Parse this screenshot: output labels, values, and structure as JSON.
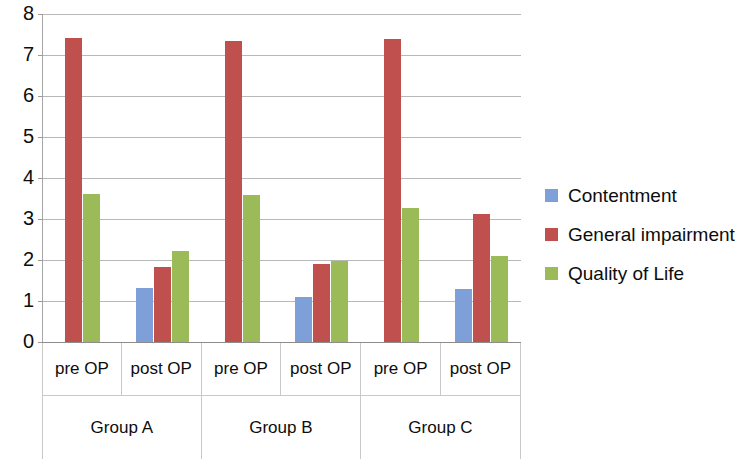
{
  "chart_data": {
    "type": "bar",
    "title": "",
    "subtitle": "",
    "xlabel": "",
    "ylabel": "",
    "ylim": [
      0,
      8
    ],
    "ytick_labels": [
      "8",
      "7",
      "6",
      "5",
      "4",
      "3",
      "2",
      "1",
      "0"
    ],
    "ytick_values": [
      8,
      7,
      6,
      5,
      4,
      3,
      2,
      1,
      0
    ],
    "grid": true,
    "legend_position": "right",
    "categories": [
      "pre OP",
      "post OP",
      "pre OP",
      "post OP",
      "pre OP",
      "post OP"
    ],
    "groups": [
      {
        "label": "Group A",
        "categories": [
          "pre OP",
          "post OP"
        ]
      },
      {
        "label": "Group B",
        "categories": [
          "pre OP",
          "post OP"
        ]
      },
      {
        "label": "Group C",
        "categories": [
          "pre OP",
          "post OP"
        ]
      }
    ],
    "series": [
      {
        "name": "Contentment",
        "color": "#7F9FD9",
        "values": [
          null,
          1.32,
          null,
          1.1,
          null,
          1.3
        ]
      },
      {
        "name": "General impairment",
        "color": "#C0504D",
        "values": [
          7.42,
          1.82,
          7.33,
          1.9,
          7.4,
          3.12
        ]
      },
      {
        "name": "Quality of Life",
        "color": "#9BBB59",
        "values": [
          3.6,
          2.22,
          3.58,
          1.97,
          3.28,
          2.1
        ]
      }
    ]
  },
  "legend": {
    "items": [
      {
        "label": "Contentment",
        "swatch": "legend-swatch-contentment"
      },
      {
        "label": "General impairment",
        "swatch": "legend-swatch-impairment"
      },
      {
        "label": "Quality of Life",
        "swatch": "legend-swatch-quality"
      }
    ]
  },
  "axis": {
    "y_labels": [
      "8",
      "7",
      "6",
      "5",
      "4",
      "3",
      "2",
      "1",
      "0"
    ],
    "x_cells": [
      "pre OP",
      "post OP",
      "pre OP",
      "post OP",
      "pre OP",
      "post OP"
    ],
    "group_cells": [
      "Group A",
      "Group B",
      "Group C"
    ]
  }
}
